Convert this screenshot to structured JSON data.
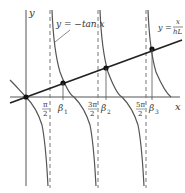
{
  "diagram": {
    "axis_labels": {
      "x": "x",
      "y": "y"
    },
    "curve_label": "y = −tan x",
    "line_label": {
      "prefix": "y =",
      "numerator": "x",
      "denominator": "hL"
    },
    "ticks": [
      {
        "num": "π",
        "den": "2",
        "coef": ""
      },
      {
        "name": "β",
        "sub": "1"
      },
      {
        "num": "3π",
        "den": "2"
      },
      {
        "name": "β",
        "sub": "2"
      },
      {
        "num": "5π",
        "den": "2"
      },
      {
        "name": "β",
        "sub": "3"
      }
    ],
    "colors": {
      "curve": "#555555",
      "line": "#222222",
      "axis": "#555555",
      "dash": "#777777",
      "point": "#111111"
    }
  }
}
